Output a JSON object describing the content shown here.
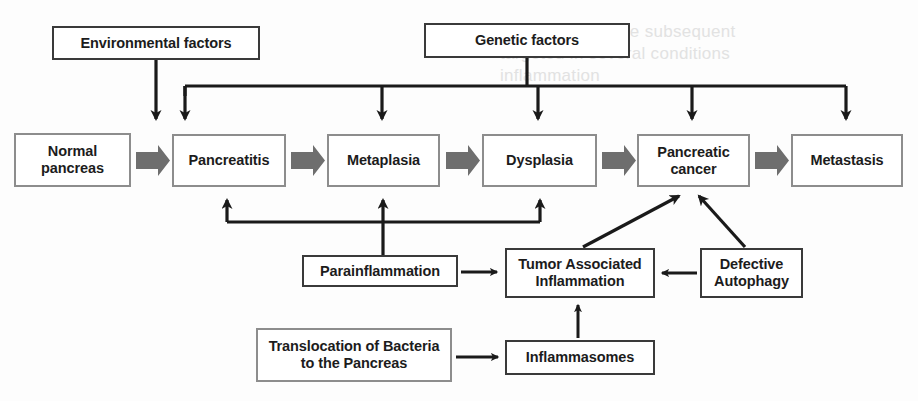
{
  "diagram": {
    "colors": {
      "box_border_dark": "#3a3a3a",
      "box_border_light": "#8d8d8d",
      "arrow_thick_fill": "#6e6e6e",
      "arrow_thin_stroke": "#1a1a1a",
      "text": "#1c1c1c",
      "background": "#fdfdfd",
      "ghost_text": "#e2e2e2"
    },
    "nodes": [
      {
        "id": "environmental-factors",
        "label": "Environmental factors",
        "x": 52,
        "y": 26,
        "w": 208,
        "h": 34,
        "style": "dark"
      },
      {
        "id": "genetic-factors",
        "label": "Genetic factors",
        "x": 424,
        "y": 23,
        "w": 206,
        "h": 35,
        "style": "dark"
      },
      {
        "id": "normal-pancreas",
        "label": "Normal\npancreas",
        "x": 14,
        "y": 133,
        "w": 117,
        "h": 54,
        "style": "light"
      },
      {
        "id": "pancreatitis",
        "label": "Pancreatitis",
        "x": 172,
        "y": 134,
        "w": 114,
        "h": 53,
        "style": "light"
      },
      {
        "id": "metaplasia",
        "label": "Metaplasia",
        "x": 327,
        "y": 134,
        "w": 113,
        "h": 53,
        "style": "light"
      },
      {
        "id": "dysplasia",
        "label": "Dysplasia",
        "x": 482,
        "y": 134,
        "w": 115,
        "h": 53,
        "style": "light"
      },
      {
        "id": "pancreatic-cancer",
        "label": "Pancreatic\ncancer",
        "x": 637,
        "y": 134,
        "w": 113,
        "h": 53,
        "style": "light"
      },
      {
        "id": "metastasis",
        "label": "Metastasis",
        "x": 791,
        "y": 134,
        "w": 112,
        "h": 53,
        "style": "light"
      },
      {
        "id": "parainflammation",
        "label": "Parainflammation",
        "x": 302,
        "y": 255,
        "w": 156,
        "h": 32,
        "style": "dark"
      },
      {
        "id": "tumor-associated-inflammation",
        "label": "Tumor Associated\nInflammation",
        "x": 505,
        "y": 248,
        "w": 150,
        "h": 50,
        "style": "dark"
      },
      {
        "id": "defective-autophagy",
        "label": "Defective\nAutophagy",
        "x": 700,
        "y": 248,
        "w": 103,
        "h": 50,
        "style": "dark"
      },
      {
        "id": "translocation-of-bacteria",
        "label": "Translocation of Bacteria\nto the Pancreas",
        "x": 256,
        "y": 328,
        "w": 196,
        "h": 54,
        "style": "light"
      },
      {
        "id": "inflammasomes",
        "label": "Inflammasomes",
        "x": 505,
        "y": 340,
        "w": 150,
        "h": 35,
        "style": "dark"
      }
    ],
    "flow_arrows": [
      {
        "id": "normal-pancreas-to-pancreatitis",
        "from": "normal-pancreas",
        "to": "pancreatitis"
      },
      {
        "id": "pancreatitis-to-metaplasia",
        "from": "pancreatitis",
        "to": "metaplasia"
      },
      {
        "id": "metaplasia-to-dysplasia",
        "from": "metaplasia",
        "to": "dysplasia"
      },
      {
        "id": "dysplasia-to-pancreatic-cancer",
        "from": "dysplasia",
        "to": "pancreatic-cancer"
      },
      {
        "id": "pancreatic-cancer-to-metastasis",
        "from": "pancreatic-cancer",
        "to": "metastasis"
      }
    ],
    "influence_arrows": [
      {
        "id": "environmental-to-pancreatitis",
        "from": "environmental-factors",
        "to": "pancreatitis"
      },
      {
        "id": "genetic-to-pancreatitis",
        "from": "genetic-factors",
        "to": "pancreatitis"
      },
      {
        "id": "genetic-to-metaplasia",
        "from": "genetic-factors",
        "to": "metaplasia"
      },
      {
        "id": "genetic-to-dysplasia",
        "from": "genetic-factors",
        "to": "dysplasia"
      },
      {
        "id": "genetic-to-pancreatic-cancer",
        "from": "genetic-factors",
        "to": "pancreatic-cancer"
      },
      {
        "id": "genetic-to-metastasis",
        "from": "genetic-factors",
        "to": "metastasis"
      },
      {
        "id": "parainflammation-to-pancreatitis",
        "from": "parainflammation",
        "to": "pancreatitis"
      },
      {
        "id": "parainflammation-to-metaplasia",
        "from": "parainflammation",
        "to": "metaplasia"
      },
      {
        "id": "parainflammation-to-dysplasia",
        "from": "parainflammation",
        "to": "dysplasia"
      },
      {
        "id": "parainflammation-to-tumor-associated-inflammation",
        "from": "parainflammation",
        "to": "tumor-associated-inflammation"
      },
      {
        "id": "tumor-associated-inflammation-to-pancreatic-cancer",
        "from": "tumor-associated-inflammation",
        "to": "pancreatic-cancer"
      },
      {
        "id": "defective-autophagy-to-pancreatic-cancer",
        "from": "defective-autophagy",
        "to": "pancreatic-cancer"
      },
      {
        "id": "defective-autophagy-to-tumor-associated-inflammation",
        "from": "defective-autophagy",
        "to": "tumor-associated-inflammation"
      },
      {
        "id": "inflammasomes-to-tumor-associated-inflammation",
        "from": "inflammasomes",
        "to": "tumor-associated-inflammation"
      },
      {
        "id": "translocation-to-inflammasomes",
        "from": "translocation-of-bacteria",
        "to": "inflammasomes"
      }
    ],
    "ghost_text": [
      {
        "text": "cancer, and in the subsequent",
        "x": 500,
        "y": 22,
        "size": 17
      },
      {
        "text": "targeted in several conditions",
        "x": 500,
        "y": 44,
        "size": 17
      },
      {
        "text": "inflammation",
        "x": 500,
        "y": 66,
        "size": 17
      }
    ]
  }
}
